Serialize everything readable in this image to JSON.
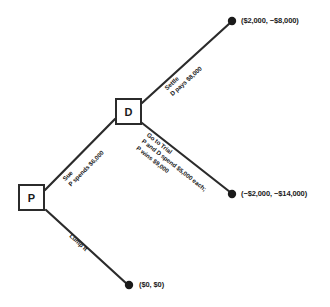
{
  "figure": {
    "type": "decision-tree",
    "top_caption": "",
    "nodes": [
      {
        "id": "P",
        "label": "P",
        "kind": "decision-square",
        "x": 18,
        "y": 184,
        "w": 27,
        "h": 27
      },
      {
        "id": "D",
        "label": "D",
        "kind": "decision-square",
        "x": 115,
        "y": 98,
        "w": 27,
        "h": 27
      }
    ],
    "terminals": [
      {
        "id": "t-settle",
        "payoff": "($2,000, −$8,000)",
        "x": 232,
        "y": 21
      },
      {
        "id": "t-trial",
        "payoff": "(−$2,000, −$14,000)",
        "x": 232,
        "y": 194
      },
      {
        "id": "t-lump",
        "payoff": "($0, $0)",
        "x": 129,
        "y": 285
      }
    ],
    "edges": [
      {
        "id": "edge-sue",
        "from": "P",
        "to": "D",
        "line1": "Sue",
        "line2": "P spends $6,000",
        "x1": 45,
        "y1": 190,
        "x2": 115,
        "y2": 119
      },
      {
        "id": "edge-settle",
        "from": "D",
        "to": "t-settle",
        "line1": "Settle",
        "line2": "D pays $8,000",
        "x1": 142,
        "y1": 103,
        "x2": 230,
        "y2": 23
      },
      {
        "id": "edge-trial",
        "from": "D",
        "to": "t-trial",
        "line1": "Go to Trial",
        "line2": "P and D spend $5,000 each;",
        "line3": "P wins $9,000",
        "x1": 142,
        "y1": 123,
        "x2": 230,
        "y2": 192
      },
      {
        "id": "edge-lump",
        "from": "P",
        "to": "t-lump",
        "line1": "Lump It",
        "line2": "",
        "x1": 46,
        "y1": 210,
        "x2": 127,
        "y2": 284
      }
    ],
    "colors": {
      "line": "#2b2b2b",
      "text": "#1a1a1a",
      "background": "#ffffff"
    }
  }
}
